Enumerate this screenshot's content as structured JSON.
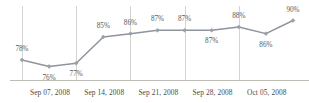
{
  "chart_data": {
    "type": "line",
    "title": "",
    "xlabel": "",
    "ylabel": "",
    "grid": true,
    "legend": "none",
    "ylim": [
      74,
      92
    ],
    "xlim": [
      0,
      10
    ],
    "axis_ticks": [
      {
        "label": "Sep 07, 2008",
        "x": 0
      },
      {
        "label": "Sep 14, 2008",
        "x": 2
      },
      {
        "label": "Sep 21, 2008",
        "x": 4
      },
      {
        "label": "Sep 28, 2008",
        "x": 6
      },
      {
        "label": "Oct 05, 2008",
        "x": 8
      }
    ],
    "series": [
      {
        "name": "",
        "color": "#8e949c",
        "marker": "diamond",
        "points": [
          {
            "x": 0,
            "y": 78,
            "label": "78%",
            "label_pos": "above"
          },
          {
            "x": 1,
            "y": 76,
            "label": "76%",
            "label_pos": "below"
          },
          {
            "x": 2,
            "y": 77,
            "label": "77%",
            "label_pos": "below"
          },
          {
            "x": 3,
            "y": 85,
            "label": "85%",
            "label_pos": "above"
          },
          {
            "x": 4,
            "y": 86,
            "label": "86%",
            "label_pos": "above"
          },
          {
            "x": 5,
            "y": 87,
            "label": "87%",
            "label_pos": "above"
          },
          {
            "x": 6,
            "y": 87,
            "label": "87%",
            "label_pos": "above"
          },
          {
            "x": 7,
            "y": 87,
            "label": "87%",
            "label_pos": "below"
          },
          {
            "x": 8,
            "y": 88,
            "label": "88%",
            "label_pos": "above"
          },
          {
            "x": 9,
            "y": 86,
            "label": "86%",
            "label_pos": "below"
          },
          {
            "x": 10,
            "y": 90,
            "label": "90%",
            "label_pos": "above"
          }
        ]
      }
    ],
    "colors": {
      "line": "#8e949c",
      "marker": "#9aa0a6",
      "gridline": "#c9c9c4",
      "axis": "#b5b5ae",
      "text": "#55554f"
    }
  }
}
